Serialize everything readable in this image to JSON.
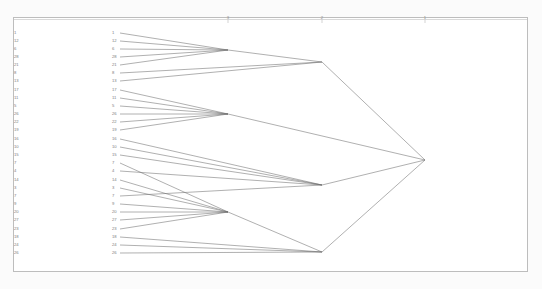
{
  "figure": {
    "type": "dendrogram",
    "background_color": "#fbfbfb",
    "panel_background": "#ffffff",
    "panel_border_color": "#bdbdbd",
    "line_color": "#6e6e6e",
    "label_color": "#7d7d7d"
  },
  "axis": {
    "position": "top",
    "line_color": "#bdbdbd",
    "ticks": [
      {
        "label": "3",
        "x": 228
      },
      {
        "label": "2",
        "x": 322
      },
      {
        "label": "1",
        "x": 425
      }
    ]
  },
  "leaf_labels_left": [
    "1",
    "12",
    "6",
    "28",
    "21",
    "8",
    "13",
    "17",
    "11",
    "5",
    "26",
    "22",
    "19",
    "16",
    "10",
    "15",
    "7",
    "4",
    "14",
    "3",
    "7",
    "9",
    "20",
    "27",
    "23",
    "18",
    "24",
    "26"
  ],
  "leaf_labels_inner": [
    "1",
    "12",
    "6",
    "28",
    "21",
    "8",
    "13",
    "17",
    "11",
    "5",
    "26",
    "22",
    "19",
    "16",
    "10",
    "15",
    "7",
    "4",
    "14",
    "3",
    "7",
    "9",
    "20",
    "27",
    "23",
    "18",
    "24",
    "26"
  ],
  "chart_data": {
    "type": "dendrogram",
    "orientation": "horizontal-right",
    "title": "",
    "xlabel": "",
    "ylabel": "",
    "leaf_count": 28,
    "axis_tick_labels": [
      "3",
      "2",
      "1"
    ],
    "leaves": [
      {
        "label": "1",
        "y": 33
      },
      {
        "label": "12",
        "y": 41
      },
      {
        "label": "6",
        "y": 49
      },
      {
        "label": "28",
        "y": 57
      },
      {
        "label": "21",
        "y": 65
      },
      {
        "label": "8",
        "y": 73
      },
      {
        "label": "13",
        "y": 81
      },
      {
        "label": "17",
        "y": 90
      },
      {
        "label": "11",
        "y": 98
      },
      {
        "label": "5",
        "y": 106
      },
      {
        "label": "26",
        "y": 114
      },
      {
        "label": "22",
        "y": 122
      },
      {
        "label": "19",
        "y": 130
      },
      {
        "label": "16",
        "y": 139
      },
      {
        "label": "10",
        "y": 147
      },
      {
        "label": "15",
        "y": 155
      },
      {
        "label": "7",
        "y": 163
      },
      {
        "label": "4",
        "y": 171
      },
      {
        "label": "14",
        "y": 180
      },
      {
        "label": "3",
        "y": 188
      },
      {
        "label": "7",
        "y": 196
      },
      {
        "label": "9",
        "y": 204
      },
      {
        "label": "20",
        "y": 212
      },
      {
        "label": "27",
        "y": 220
      },
      {
        "label": "23",
        "y": 229
      },
      {
        "label": "18",
        "y": 237
      },
      {
        "label": "24",
        "y": 245
      },
      {
        "label": "26",
        "y": 253
      }
    ],
    "leaf_x": 120,
    "merges": [
      {
        "id": "c1",
        "x": 228,
        "y": 50,
        "children": [
          "1",
          "12",
          "6",
          "28",
          "21"
        ]
      },
      {
        "id": "c2",
        "x": 228,
        "y": 114,
        "children": [
          "17",
          "11",
          "5",
          "26",
          "22",
          "19"
        ]
      },
      {
        "id": "c3",
        "x": 228,
        "y": 212,
        "children": [
          "14",
          "3",
          "7",
          "9",
          "20",
          "27",
          "23"
        ]
      },
      {
        "id": "n1",
        "x": 322,
        "y": 62,
        "children": [
          "c1",
          "8",
          "13"
        ]
      },
      {
        "id": "n2",
        "x": 322,
        "y": 185,
        "children": [
          "16",
          "10",
          "15",
          "7",
          "4"
        ]
      },
      {
        "id": "n3",
        "x": 322,
        "y": 252,
        "children": [
          "c3",
          "18",
          "24",
          "26"
        ]
      },
      {
        "id": "root",
        "x": 425,
        "y": 160,
        "children": [
          "n1",
          "c2",
          "n2",
          "n3"
        ]
      }
    ]
  }
}
